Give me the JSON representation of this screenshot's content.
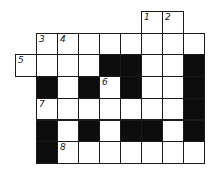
{
  "puzzle": {
    "type": "crossword",
    "origin": {
      "x": 15,
      "y": 11
    },
    "cell_w": 21,
    "cell_h": 21.7,
    "colors": {
      "black": "#0d0d0d",
      "white": "#ffffff",
      "border": "#1a1a1a"
    },
    "cells": [
      {
        "r": 0,
        "c": 6,
        "type": "white",
        "num": "1"
      },
      {
        "r": 0,
        "c": 7,
        "type": "white",
        "num": "2"
      },
      {
        "r": 1,
        "c": 1,
        "type": "white",
        "num": "3"
      },
      {
        "r": 1,
        "c": 2,
        "type": "white",
        "num": "4"
      },
      {
        "r": 1,
        "c": 3,
        "type": "white"
      },
      {
        "r": 1,
        "c": 4,
        "type": "white"
      },
      {
        "r": 1,
        "c": 5,
        "type": "white"
      },
      {
        "r": 1,
        "c": 6,
        "type": "white"
      },
      {
        "r": 1,
        "c": 7,
        "type": "white"
      },
      {
        "r": 1,
        "c": 8,
        "type": "white"
      },
      {
        "r": 2,
        "c": 0,
        "type": "white",
        "num": "5"
      },
      {
        "r": 2,
        "c": 1,
        "type": "white"
      },
      {
        "r": 2,
        "c": 2,
        "type": "white"
      },
      {
        "r": 2,
        "c": 3,
        "type": "white"
      },
      {
        "r": 2,
        "c": 4,
        "type": "black"
      },
      {
        "r": 2,
        "c": 5,
        "type": "black"
      },
      {
        "r": 2,
        "c": 6,
        "type": "white"
      },
      {
        "r": 2,
        "c": 7,
        "type": "white"
      },
      {
        "r": 2,
        "c": 8,
        "type": "black"
      },
      {
        "r": 3,
        "c": 1,
        "type": "black"
      },
      {
        "r": 3,
        "c": 2,
        "type": "white"
      },
      {
        "r": 3,
        "c": 3,
        "type": "black"
      },
      {
        "r": 3,
        "c": 4,
        "type": "white",
        "num": "6"
      },
      {
        "r": 3,
        "c": 5,
        "type": "black"
      },
      {
        "r": 3,
        "c": 6,
        "type": "white"
      },
      {
        "r": 3,
        "c": 7,
        "type": "white"
      },
      {
        "r": 3,
        "c": 8,
        "type": "black"
      },
      {
        "r": 4,
        "c": 1,
        "type": "white",
        "num": "7"
      },
      {
        "r": 4,
        "c": 2,
        "type": "white"
      },
      {
        "r": 4,
        "c": 3,
        "type": "white"
      },
      {
        "r": 4,
        "c": 4,
        "type": "white"
      },
      {
        "r": 4,
        "c": 5,
        "type": "white"
      },
      {
        "r": 4,
        "c": 6,
        "type": "white"
      },
      {
        "r": 4,
        "c": 7,
        "type": "white"
      },
      {
        "r": 4,
        "c": 8,
        "type": "black"
      },
      {
        "r": 5,
        "c": 1,
        "type": "black"
      },
      {
        "r": 5,
        "c": 2,
        "type": "white"
      },
      {
        "r": 5,
        "c": 3,
        "type": "black"
      },
      {
        "r": 5,
        "c": 4,
        "type": "white"
      },
      {
        "r": 5,
        "c": 5,
        "type": "black"
      },
      {
        "r": 5,
        "c": 6,
        "type": "black"
      },
      {
        "r": 5,
        "c": 7,
        "type": "white"
      },
      {
        "r": 5,
        "c": 8,
        "type": "black"
      },
      {
        "r": 6,
        "c": 1,
        "type": "black"
      },
      {
        "r": 6,
        "c": 2,
        "type": "white",
        "num": "8"
      },
      {
        "r": 6,
        "c": 3,
        "type": "white"
      },
      {
        "r": 6,
        "c": 4,
        "type": "white"
      },
      {
        "r": 6,
        "c": 5,
        "type": "white"
      },
      {
        "r": 6,
        "c": 6,
        "type": "white"
      },
      {
        "r": 6,
        "c": 7,
        "type": "white"
      },
      {
        "r": 6,
        "c": 8,
        "type": "white"
      }
    ]
  }
}
